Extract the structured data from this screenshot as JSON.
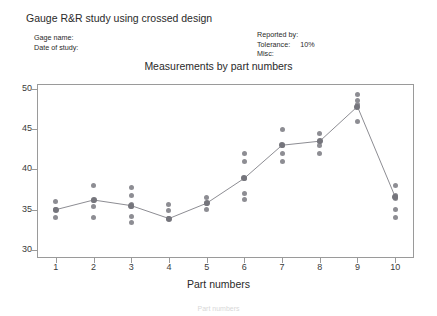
{
  "report": {
    "title": "Gauge R&R study using crossed design",
    "gage_name_label": "Gage name:",
    "gage_name_value": "",
    "date_of_study_label": "Date of study:",
    "date_of_study_value": "",
    "reported_by_label": "Reported by:",
    "reported_by_value": "",
    "tolerance_label": "Tolerance:",
    "tolerance_value": "10%",
    "misc_label": "Misc:",
    "misc_value": ""
  },
  "caption": "Part numbers",
  "chart_data": {
    "type": "scatter",
    "title": "Measurements by part numbers",
    "xlabel": "Part numbers",
    "ylabel": "",
    "categories": [
      "1",
      "2",
      "3",
      "4",
      "5",
      "6",
      "7",
      "8",
      "9",
      "10"
    ],
    "xtick_labels": [
      "1",
      "2",
      "3",
      "4",
      "5",
      "6",
      "7",
      "8",
      "9",
      "10"
    ],
    "ytick_labels": [
      "30",
      "35",
      "40",
      "45",
      "50"
    ],
    "ytick_values": [
      30,
      35,
      40,
      45,
      50
    ],
    "ylim": [
      29,
      50.6
    ],
    "xlim": [
      0.5,
      10.5
    ],
    "grid": false,
    "legend": false,
    "series": [
      {
        "name": "Measurements",
        "points": [
          [
            34.0,
            35.0,
            36.0
          ],
          [
            34.0,
            35.4,
            36.2,
            38.0
          ],
          [
            33.4,
            34.2,
            35.4,
            35.6,
            36.8,
            37.8
          ],
          [
            33.9,
            34.9,
            35.6
          ],
          [
            35.0,
            35.8,
            36.5
          ],
          [
            36.3,
            37.0,
            38.9,
            41.0,
            42.0
          ],
          [
            41.0,
            42.0,
            43.0,
            45.0
          ],
          [
            42.0,
            43.0,
            43.5,
            44.5
          ],
          [
            46.0,
            48.0,
            48.6,
            49.3
          ],
          [
            34.0,
            35.0,
            36.4,
            36.8,
            38.0
          ]
        ]
      },
      {
        "name": "Mean by part",
        "values": [
          35.0,
          36.2,
          35.5,
          33.9,
          35.8,
          38.9,
          43.0,
          43.5,
          47.8,
          36.6
        ]
      }
    ]
  },
  "colors": {
    "point": "#8d8d93",
    "mean_point": "#75757c",
    "mean_line": "#8d8d93",
    "axis": "#9a9a9a",
    "text": "#2a2a2a"
  }
}
